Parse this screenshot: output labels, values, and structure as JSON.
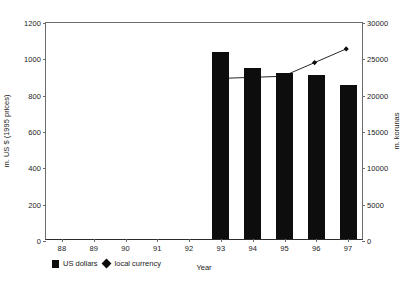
{
  "chart_data": {
    "type": "bar",
    "title": "",
    "subtitle": "",
    "xlabel": "Year",
    "categories": [
      "88",
      "89",
      "90",
      "91",
      "92",
      "93",
      "94",
      "95",
      "96",
      "97"
    ],
    "axes": {
      "left": {
        "label": "m. US $ (1995 prices)",
        "ticks": [
          0,
          200,
          400,
          600,
          800,
          1000,
          1200
        ],
        "tick_labels": [
          "0",
          "200",
          "400",
          "600",
          "800",
          "1000",
          "1200"
        ],
        "min": 0,
        "max": 1200
      },
      "right": {
        "label": "m. korunas",
        "ticks": [
          0,
          5000,
          10000,
          15000,
          20000,
          25000,
          30000
        ],
        "tick_labels": [
          "0",
          "5000",
          "10000",
          "15000",
          "20000",
          "25000",
          "30000"
        ],
        "min": 0,
        "max": 30000
      }
    },
    "grid": false,
    "legend_position": "bottom-left",
    "series": [
      {
        "name": "US dollars",
        "type": "bar",
        "axis": "left",
        "color": "#0d0d0d",
        "values": [
          null,
          null,
          null,
          null,
          null,
          1030,
          940,
          915,
          905,
          850
        ]
      },
      {
        "name": "local currency",
        "type": "line",
        "axis": "right",
        "color": "#0d0d0d",
        "marker": "diamond",
        "values": [
          null,
          null,
          null,
          null,
          null,
          22300,
          22450,
          22600,
          24500,
          26400
        ]
      }
    ]
  },
  "legend": {
    "bar_label": "US dollars",
    "line_label": "local currency"
  }
}
